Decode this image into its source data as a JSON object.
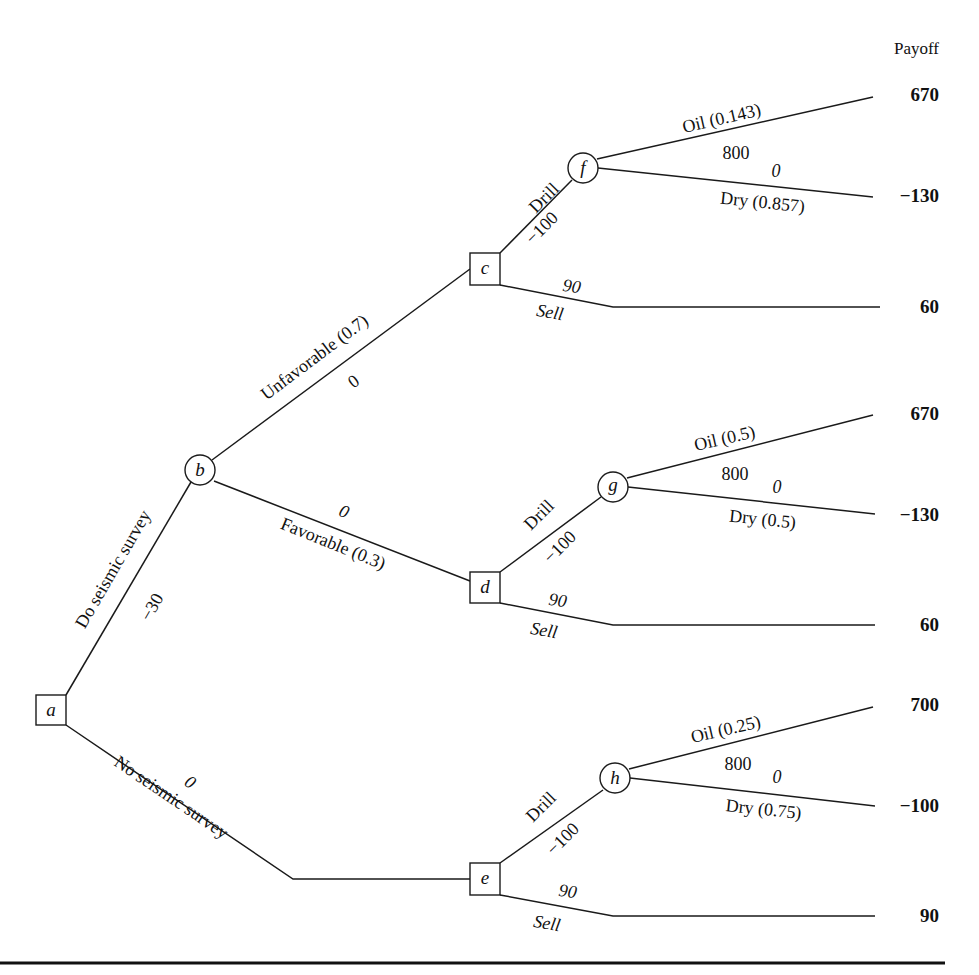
{
  "header": {
    "payoff_label": "Payoff"
  },
  "nodes": {
    "a": {
      "label": "a",
      "type": "decision"
    },
    "b": {
      "label": "b",
      "type": "chance"
    },
    "c": {
      "label": "c",
      "type": "decision"
    },
    "d": {
      "label": "d",
      "type": "decision"
    },
    "e": {
      "label": "e",
      "type": "decision"
    },
    "f": {
      "label": "f",
      "type": "chance"
    },
    "g": {
      "label": "g",
      "type": "chance"
    },
    "h": {
      "label": "h",
      "type": "chance"
    }
  },
  "branches": {
    "a_b": {
      "label": "Do seismic survey",
      "value": "−30"
    },
    "a_e": {
      "label": "No seismic survey",
      "value": "0"
    },
    "b_c": {
      "label": "Unfavorable (0.7)",
      "value": "0"
    },
    "b_d": {
      "label": "Favorable (0.3)",
      "value": "0"
    },
    "c_f": {
      "label": "Drill",
      "value": "−100"
    },
    "c_sell": {
      "label": "Sell",
      "value": "90"
    },
    "d_g": {
      "label": "Drill",
      "value": "−100"
    },
    "d_sell": {
      "label": "Sell",
      "value": "90"
    },
    "e_h": {
      "label": "Drill",
      "value": "−100"
    },
    "e_sell": {
      "label": "Sell",
      "value": "90"
    },
    "f_oil": {
      "label": "Oil (0.143)",
      "value": "800"
    },
    "f_dry": {
      "label": "Dry (0.857)",
      "value": "0"
    },
    "g_oil": {
      "label": "Oil (0.5)",
      "value": "800"
    },
    "g_dry": {
      "label": "Dry (0.5)",
      "value": "0"
    },
    "h_oil": {
      "label": "Oil (0.25)",
      "value": "800"
    },
    "h_dry": {
      "label": "Dry (0.75)",
      "value": "0"
    }
  },
  "payoffs": {
    "f_oil": "670",
    "f_dry": "−130",
    "c_sell": "60",
    "g_oil": "670",
    "g_dry": "−130",
    "d_sell": "60",
    "h_oil": "700",
    "h_dry": "−100",
    "e_sell": "90"
  }
}
